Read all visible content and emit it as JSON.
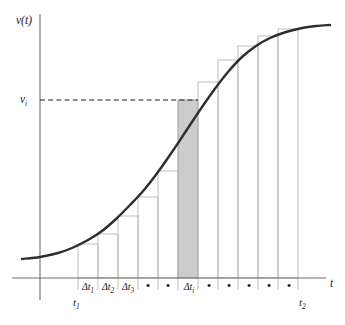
{
  "figure": {
    "title": "",
    "background_color": "#ffffff",
    "curve_color": "#2e2e2e",
    "bar_outline_color": "#b9b9b9",
    "shaded_bar_color": "#cccccc",
    "axis_color": "#6e6e6e",
    "dashed_line_color": "#1d1d1d"
  },
  "axes": {
    "y_axis_label": "v(t)",
    "x_axis_label": "t",
    "origin_x": 40,
    "origin_y": 278,
    "x_axis_end": 326,
    "y_axis_top": 14,
    "y_axis_bottom": 300
  },
  "value_markers": {
    "v_i_label": "v",
    "v_i_subscript": "i",
    "v_i_y": 100,
    "t1_label": "t",
    "t1_subscript": "1",
    "t1_x": 78,
    "t2_label": "t",
    "t2_subscript": "2",
    "t2_x": 303
  },
  "interval_labels": [
    {
      "text": "Δt",
      "sub": "1",
      "x": 88,
      "kind": "delta"
    },
    {
      "text": "Δt",
      "sub": "2",
      "x": 108,
      "kind": "delta"
    },
    {
      "text": "Δt",
      "sub": "3",
      "x": 128,
      "kind": "delta"
    },
    {
      "text": "•",
      "sub": "",
      "x": 148,
      "kind": "dot"
    },
    {
      "text": "•",
      "sub": "",
      "x": 168,
      "kind": "dot"
    },
    {
      "text": "Δt",
      "sub": "i",
      "x": 189,
      "kind": "delta"
    },
    {
      "text": "•",
      "sub": "",
      "x": 209,
      "kind": "dot"
    },
    {
      "text": "•",
      "sub": "",
      "x": 229,
      "kind": "dot"
    },
    {
      "text": "•",
      "sub": "",
      "x": 249,
      "kind": "dot"
    },
    {
      "text": "•",
      "sub": "",
      "x": 269,
      "kind": "dot"
    },
    {
      "text": "•",
      "sub": "",
      "x": 289,
      "kind": "dot"
    }
  ],
  "chart_data": {
    "type": "area",
    "xlabel": "t",
    "ylabel": "v(t)",
    "grid": false,
    "legend": false,
    "xlim": [
      0,
      345
    ],
    "ylim": [
      278,
      14
    ],
    "curve_points": [
      [
        22,
        259
      ],
      [
        40,
        257
      ],
      [
        58,
        253
      ],
      [
        72,
        248
      ],
      [
        88,
        240
      ],
      [
        102,
        231
      ],
      [
        116,
        219
      ],
      [
        130,
        205
      ],
      [
        144,
        190
      ],
      [
        158,
        172
      ],
      [
        172,
        152
      ],
      [
        186,
        131
      ],
      [
        200,
        110
      ],
      [
        214,
        90
      ],
      [
        228,
        72
      ],
      [
        242,
        57
      ],
      [
        256,
        46
      ],
      [
        270,
        38
      ],
      [
        286,
        32
      ],
      [
        302,
        28
      ],
      [
        316,
        26
      ],
      [
        330,
        25
      ]
    ],
    "bar_boundaries": [
      78,
      98,
      118,
      138,
      158,
      178,
      198,
      218,
      238,
      258,
      278,
      298
    ],
    "bars": [
      {
        "index": 1,
        "x0": 78,
        "x1": 98,
        "top_y": 244,
        "shaded": false,
        "label": "Δt1"
      },
      {
        "index": 2,
        "x0": 98,
        "x1": 118,
        "top_y": 234,
        "shaded": false,
        "label": "Δt2"
      },
      {
        "index": 3,
        "x0": 118,
        "x1": 138,
        "top_y": 216,
        "shaded": false,
        "label": "Δt3"
      },
      {
        "index": 4,
        "x0": 138,
        "x1": 158,
        "top_y": 197,
        "shaded": false,
        "label": "•"
      },
      {
        "index": 5,
        "x0": 158,
        "x1": 178,
        "top_y": 171,
        "shaded": false,
        "label": "•"
      },
      {
        "index": 6,
        "x0": 178,
        "x1": 198,
        "top_y": 100,
        "shaded": true,
        "label": "Δti"
      },
      {
        "index": 7,
        "x0": 198,
        "x1": 218,
        "top_y": 82,
        "shaded": false,
        "label": "•"
      },
      {
        "index": 8,
        "x0": 218,
        "x1": 238,
        "top_y": 60,
        "shaded": false,
        "label": "•"
      },
      {
        "index": 9,
        "x0": 238,
        "x1": 258,
        "top_y": 46,
        "shaded": false,
        "label": "•"
      },
      {
        "index": 10,
        "x0": 258,
        "x1": 278,
        "top_y": 36,
        "shaded": false,
        "label": "•"
      },
      {
        "index": 11,
        "x0": 278,
        "x1": 298,
        "top_y": 29,
        "shaded": false,
        "label": "•"
      }
    ],
    "shaded_bar": {
      "index": 6,
      "x0": 178,
      "x1": 198,
      "height_value_label": "v_i",
      "width_label": "Δt_i",
      "fill": "#cccccc"
    },
    "annotations": [
      {
        "text": "v(t)",
        "x": 18,
        "y": 22,
        "role": "y-axis-label"
      },
      {
        "text": "t",
        "x": 332,
        "y": 286,
        "role": "x-axis-label"
      },
      {
        "text": "v_i",
        "x": 22,
        "y": 102,
        "role": "value-marker"
      },
      {
        "text": "t_1",
        "x": 74,
        "y": 305,
        "role": "lower-limit"
      },
      {
        "text": "t_2",
        "x": 299,
        "y": 305,
        "role": "upper-limit"
      }
    ]
  }
}
